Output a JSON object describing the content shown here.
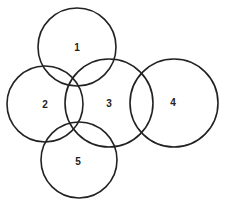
{
  "diagram": {
    "type": "overlapping-circles",
    "circles": [
      {
        "label": "1",
        "cx": 77,
        "cy": 47,
        "r": 39
      },
      {
        "label": "2",
        "cx": 45,
        "cy": 104,
        "r": 38
      },
      {
        "label": "3",
        "cx": 109,
        "cy": 103,
        "r": 44
      },
      {
        "label": "4",
        "cx": 174,
        "cy": 103,
        "r": 44
      },
      {
        "label": "5",
        "cx": 79,
        "cy": 160,
        "r": 38
      }
    ],
    "stroke_color": "#222222"
  }
}
